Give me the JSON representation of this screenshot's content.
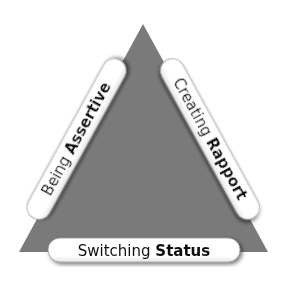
{
  "diagram": {
    "type": "triangle",
    "colors": {
      "triangle_fill": "#7a7a7a",
      "pill_fill": "#ffffff",
      "pill_stroke": "#9a9a9a",
      "text": "#111111",
      "background": "#ffffff"
    },
    "sides": [
      {
        "position": "left",
        "regular": "Being ",
        "bold": "Assertive"
      },
      {
        "position": "right",
        "regular": "Creating ",
        "bold": "Rapport"
      },
      {
        "position": "bottom",
        "regular": "Switching ",
        "bold": "Status"
      }
    ]
  }
}
